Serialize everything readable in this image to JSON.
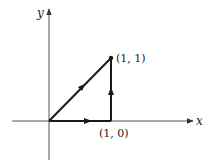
{
  "diagram": {
    "axes": {
      "x_label": "x",
      "y_label": "y"
    },
    "points": [
      {
        "id": "p11",
        "label": "(1, 1)",
        "x": 1,
        "y": 1
      },
      {
        "id": "p10",
        "label": "(1, 0)",
        "x": 1,
        "y": 0
      }
    ],
    "paths": [
      {
        "id": "diagonal",
        "from": [
          0,
          0
        ],
        "to": [
          1,
          1
        ],
        "direction": "toward (1,1)"
      },
      {
        "id": "horizontal",
        "from": [
          0,
          0
        ],
        "to": [
          1,
          0
        ],
        "direction": "toward (1,0)"
      },
      {
        "id": "vertical",
        "from": [
          1,
          0
        ],
        "to": [
          1,
          1
        ],
        "direction": "toward (1,1)"
      }
    ],
    "colors": {
      "stroke": "#1a1a1a",
      "axis": "#555555"
    }
  }
}
